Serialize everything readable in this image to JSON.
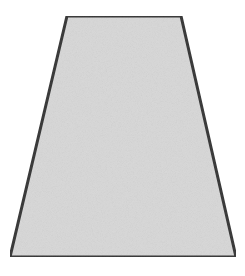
{
  "figure": {
    "shape": "trapezoid",
    "vertices": {
      "top_left": [
        67,
        16
      ],
      "top_right": [
        181,
        16
      ],
      "bottom_right": [
        236,
        257
      ],
      "bottom_left": [
        10,
        257
      ]
    },
    "colors": {
      "fill": "#d9d9d9",
      "stroke": "#3b3b3b",
      "background": "#ffffff"
    },
    "stroke_width": 3
  }
}
